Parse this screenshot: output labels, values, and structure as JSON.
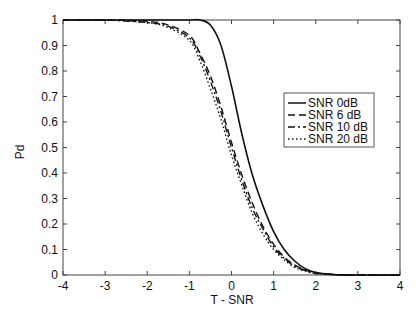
{
  "chart_data": {
    "type": "line",
    "title": "",
    "xlabel": "T - SNR",
    "ylabel": "Pd",
    "xlim": [
      -4,
      4
    ],
    "ylim": [
      0,
      1
    ],
    "grid": false,
    "legend_position": "inside right, upper-middle",
    "xticks": [
      "-4",
      "-3",
      "-2",
      "-1",
      "0",
      "1",
      "2",
      "3",
      "4"
    ],
    "yticks": [
      "0",
      "0.1",
      "0.2",
      "0.3",
      "0.4",
      "0.5",
      "0.6",
      "0.7",
      "0.8",
      "0.9",
      "1"
    ],
    "x": [
      -4,
      -3,
      -2,
      -1.5,
      -1,
      -0.75,
      -0.5,
      -0.25,
      0,
      0.25,
      0.5,
      0.75,
      1,
      1.25,
      1.5,
      1.75,
      2,
      2.5,
      3,
      4
    ],
    "series": [
      {
        "name": "SNR 0dB",
        "style": "solid",
        "values": [
          1,
          1,
          1,
          1,
          1,
          1,
          0.98,
          0.9,
          0.74,
          0.55,
          0.39,
          0.27,
          0.17,
          0.1,
          0.055,
          0.025,
          0.01,
          0.001,
          0,
          0
        ]
      },
      {
        "name": "SNR 6 dB",
        "style": "dashed",
        "values": [
          1,
          1,
          0.995,
          0.98,
          0.94,
          0.87,
          0.78,
          0.66,
          0.52,
          0.39,
          0.28,
          0.19,
          0.12,
          0.07,
          0.04,
          0.02,
          0.008,
          0.001,
          0,
          0
        ]
      },
      {
        "name": "SNR 10 dB",
        "style": "dashdot",
        "values": [
          1,
          1,
          0.99,
          0.975,
          0.93,
          0.86,
          0.76,
          0.64,
          0.5,
          0.37,
          0.26,
          0.18,
          0.11,
          0.065,
          0.035,
          0.018,
          0.007,
          0.001,
          0,
          0
        ]
      },
      {
        "name": "SNR 20 dB",
        "style": "dotted",
        "values": [
          1,
          1,
          0.99,
          0.97,
          0.92,
          0.84,
          0.73,
          0.61,
          0.47,
          0.35,
          0.24,
          0.16,
          0.1,
          0.06,
          0.03,
          0.015,
          0.006,
          0.001,
          0,
          0
        ]
      }
    ]
  }
}
